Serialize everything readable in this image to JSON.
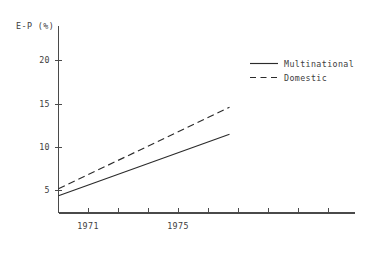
{
  "chart_data": {
    "type": "line",
    "title": "",
    "ylabel": "E-P (%)",
    "xlabel": "",
    "xlim": [
      1969.6,
      1979.8
    ],
    "ylim": [
      0,
      22.5
    ],
    "grid": false,
    "legend_position": "top-right",
    "y_ticks": [
      {
        "value": 20,
        "label": "20"
      },
      {
        "value": 15,
        "label": "15"
      },
      {
        "value": 10,
        "label": "10"
      },
      {
        "value": 5,
        "label": "5"
      }
    ],
    "x_ticks": [
      {
        "value": 1970,
        "label": ""
      },
      {
        "value": 1971,
        "label": "1971"
      },
      {
        "value": 1972,
        "label": ""
      },
      {
        "value": 1973,
        "label": ""
      },
      {
        "value": 1974,
        "label": ""
      },
      {
        "value": 1975,
        "label": "1975"
      },
      {
        "value": 1976,
        "label": ""
      },
      {
        "value": 1977,
        "label": ""
      },
      {
        "value": 1978,
        "label": ""
      },
      {
        "value": 1979,
        "label": ""
      }
    ],
    "series": [
      {
        "name": "Multinational",
        "style": "solid",
        "color": "#2b2b2b",
        "x": [
          1970.0,
          1975.7
        ],
        "values": [
          4.4,
          11.5
        ]
      },
      {
        "name": "Domestic",
        "style": "dashed",
        "color": "#2b2b2b",
        "x": [
          1970.0,
          1975.7
        ],
        "values": [
          5.2,
          14.6
        ]
      }
    ]
  },
  "legend": {
    "entries": [
      {
        "label": "Multinational",
        "style": "solid"
      },
      {
        "label": "Domestic",
        "style": "dashed"
      }
    ]
  },
  "colors": {
    "background": "#ffffff",
    "axis": "#4a4a4a",
    "line": "#2b2b2b",
    "text": "#3d3d3d"
  }
}
